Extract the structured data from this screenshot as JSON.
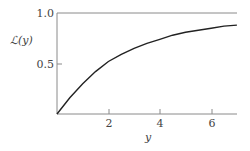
{
  "chart_data": {
    "type": "line",
    "title": "",
    "xlabel": "y",
    "ylabel": "ℒ(y)",
    "xlim": [
      0,
      7.0
    ],
    "ylim": [
      0,
      1.0
    ],
    "grid": false,
    "legend": null,
    "x_ticks": [
      "2",
      "4",
      "6"
    ],
    "y_ticks": [
      "0.5",
      "1.0"
    ],
    "reference_lines": [
      {
        "y": 1.0,
        "description": "horizontal asymptote line at 1.0"
      }
    ],
    "series": [
      {
        "name": "ℒ(y)",
        "x": [
          0,
          0.5,
          1.0,
          1.5,
          2.0,
          2.5,
          3.0,
          3.5,
          4.0,
          4.5,
          5.0,
          5.5,
          6.0,
          6.5,
          7.0
        ],
        "y": [
          0,
          0.16,
          0.3,
          0.42,
          0.52,
          0.59,
          0.65,
          0.7,
          0.74,
          0.78,
          0.81,
          0.83,
          0.85,
          0.87,
          0.88
        ]
      }
    ]
  },
  "labels": {
    "ylabel": "ℒ(y)",
    "xlabel": "y",
    "ytick_1": "1.0",
    "ytick_05": "0.5",
    "xtick_2": "2",
    "xtick_4": "4",
    "xtick_6": "6"
  }
}
